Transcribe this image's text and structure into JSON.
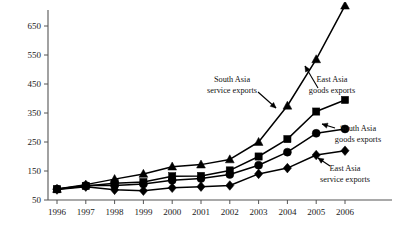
{
  "chart_data": {
    "type": "line",
    "title": "",
    "xlabel": "",
    "ylabel": "",
    "x": [
      1996,
      1997,
      1998,
      1999,
      2000,
      2001,
      2002,
      2003,
      2004,
      2005,
      2006
    ],
    "categories": [
      "1996",
      "1997",
      "1998",
      "1999",
      "2000",
      "2001",
      "2002",
      "2003",
      "2004",
      "2005",
      "2006"
    ],
    "xtick_labels": [
      "1996",
      "1997",
      "1998",
      "1999",
      "2000",
      "2001",
      "2002",
      "2003",
      "2004",
      "2005",
      "2006"
    ],
    "ytick_labels": [
      "50",
      "150",
      "250",
      "350",
      "450",
      "550",
      "650"
    ],
    "yticks": [
      50,
      150,
      250,
      350,
      450,
      550,
      650
    ],
    "ylim": [
      50,
      700
    ],
    "xlim": [
      1995.6,
      2006.4
    ],
    "grid": false,
    "legend": "annotations",
    "series": [
      {
        "name": "South Asia service exports",
        "marker": "triangle",
        "values": [
          88,
          103,
          122,
          140,
          165,
          172,
          190,
          250,
          375,
          535,
          720
        ]
      },
      {
        "name": "East Asia goods exports",
        "marker": "square",
        "values": [
          87,
          98,
          108,
          112,
          132,
          133,
          152,
          200,
          260,
          355,
          395
        ]
      },
      {
        "name": "South Asia goods exports",
        "marker": "circle",
        "values": [
          88,
          100,
          100,
          105,
          118,
          124,
          138,
          170,
          215,
          280,
          295
        ]
      },
      {
        "name": "East Asia service exports",
        "marker": "diamond",
        "values": [
          86,
          96,
          85,
          82,
          92,
          96,
          100,
          140,
          160,
          205,
          220
        ]
      }
    ],
    "annotations": [
      {
        "label_line1": "South Asia",
        "label_line2": "service exports",
        "target_series": "South Asia service exports"
      },
      {
        "label_line1": "East Asia",
        "label_line2": "goods exports",
        "target_series": "East Asia goods exports"
      },
      {
        "label_line1": "South Asia",
        "label_line2": "goods exports",
        "target_series": "South Asia goods exports"
      },
      {
        "label_line1": "East Asia",
        "label_line2": "service exports",
        "target_series": "East Asia service exports"
      }
    ],
    "colors": {
      "line": "#000000",
      "marker": "#000000",
      "axis": "#555555",
      "text": "#1a1a1a",
      "background": "#ffffff"
    }
  }
}
